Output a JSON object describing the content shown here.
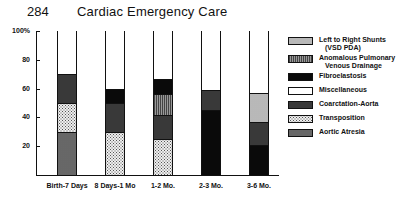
{
  "header": {
    "page_number": "284",
    "title": "Cardiac Emergency Care"
  },
  "chart_data": {
    "type": "bar",
    "stacked": true,
    "title": "Cardiac Emergency Care",
    "xlabel": "",
    "ylabel": "%",
    "ylim": [
      0,
      100
    ],
    "y_ticks": [
      "100%",
      "80",
      "60",
      "40",
      "20"
    ],
    "categories": [
      "Birth-7 Days",
      "8 Days-1 Mo",
      "1-2 Mo.",
      "2-3 Mo.",
      "3-6 Mo."
    ],
    "legend": [
      {
        "key": "lr",
        "label": "Left to Right Shunts",
        "sub": "(VSD PDA)"
      },
      {
        "key": "apv",
        "label": "Anomalous Pulmonary",
        "sub": "Venous Drainage"
      },
      {
        "key": "fib",
        "label": "Fibroelastosis",
        "sub": ""
      },
      {
        "key": "misc",
        "label": "Miscellaneous",
        "sub": ""
      },
      {
        "key": "coarc",
        "label": "Coarctation-Aorta",
        "sub": ""
      },
      {
        "key": "trans",
        "label": "Transposition",
        "sub": ""
      },
      {
        "key": "aort",
        "label": "Aortic Atresia",
        "sub": ""
      }
    ],
    "series": [
      {
        "name": "Aortic Atresia",
        "key": "aort",
        "values": [
          30,
          0,
          0,
          0,
          0
        ]
      },
      {
        "name": "Transposition",
        "key": "trans",
        "values": [
          20,
          30,
          25,
          0,
          0
        ]
      },
      {
        "name": "Fibroelastosis (base)",
        "key": "fib",
        "values": [
          0,
          0,
          0,
          45,
          21
        ]
      },
      {
        "name": "Coarctation-Aorta",
        "key": "coarc",
        "values": [
          20,
          20,
          17,
          14,
          16
        ]
      },
      {
        "name": "Left to Right Shunts (VSD PDA)",
        "key": "lr",
        "values": [
          0,
          0,
          0,
          0,
          20
        ]
      },
      {
        "name": "Anomalous Pulmonary Venous Drainage",
        "key": "apv",
        "values": [
          0,
          0,
          14,
          0,
          0
        ]
      },
      {
        "name": "Fibroelastosis",
        "key": "fib",
        "values": [
          0,
          10,
          11,
          0,
          0
        ]
      },
      {
        "name": "Miscellaneous",
        "key": "misc",
        "values": [
          30,
          40,
          33,
          41,
          43
        ]
      }
    ],
    "bars": [
      {
        "label": "Birth-7 Days",
        "segments": [
          {
            "key": "aort",
            "from": 0,
            "to": 30
          },
          {
            "key": "trans",
            "from": 30,
            "to": 50
          },
          {
            "key": "coarc",
            "from": 50,
            "to": 70
          },
          {
            "key": "misc",
            "from": 70,
            "to": 100
          }
        ]
      },
      {
        "label": "8 Days-1 Mo",
        "segments": [
          {
            "key": "trans",
            "from": 0,
            "to": 30
          },
          {
            "key": "coarc",
            "from": 30,
            "to": 50
          },
          {
            "key": "fib",
            "from": 50,
            "to": 60
          },
          {
            "key": "misc",
            "from": 60,
            "to": 100
          }
        ]
      },
      {
        "label": "1-2 Mo.",
        "segments": [
          {
            "key": "trans",
            "from": 0,
            "to": 25
          },
          {
            "key": "coarc",
            "from": 25,
            "to": 42
          },
          {
            "key": "apv",
            "from": 42,
            "to": 56
          },
          {
            "key": "fib",
            "from": 56,
            "to": 67
          },
          {
            "key": "misc",
            "from": 67,
            "to": 100
          }
        ]
      },
      {
        "label": "2-3 Mo.",
        "segments": [
          {
            "key": "fib",
            "from": 0,
            "to": 45
          },
          {
            "key": "coarc",
            "from": 45,
            "to": 59
          },
          {
            "key": "misc",
            "from": 59,
            "to": 100
          }
        ]
      },
      {
        "label": "3-6 Mo.",
        "segments": [
          {
            "key": "fib",
            "from": 0,
            "to": 21
          },
          {
            "key": "coarc",
            "from": 21,
            "to": 37
          },
          {
            "key": "lr",
            "from": 37,
            "to": 57
          },
          {
            "key": "misc",
            "from": 57,
            "to": 100
          }
        ]
      }
    ],
    "grid": false,
    "legend_position": "right"
  }
}
